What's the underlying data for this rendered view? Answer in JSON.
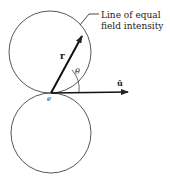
{
  "diagram": {
    "annotation": {
      "line1": "Line of equal",
      "line2": "field intensity"
    },
    "labels": {
      "vector_r": "r",
      "angle": "θ",
      "unit_vector": "û",
      "charge": "e"
    },
    "colors": {
      "stroke": "#333333",
      "text": "#222222",
      "background": "#ffffff"
    }
  }
}
